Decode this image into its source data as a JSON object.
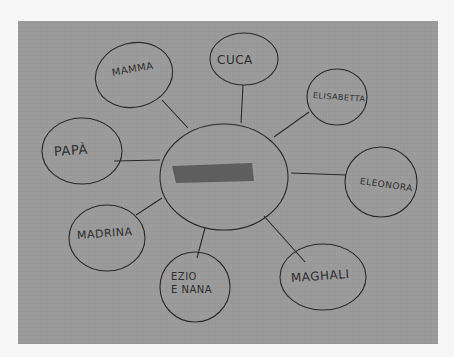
{
  "diagram": {
    "type": "hand-drawn mind map (photograph)",
    "paper_color": "#9a9a9a",
    "ink_color": "#2a2a2a",
    "border_color": "#f7f7f7",
    "center": {
      "label": "[redacted]",
      "redacted": true
    },
    "nodes": [
      {
        "id": "mamma",
        "label": "MAMMA"
      },
      {
        "id": "cuca",
        "label": "CUCA"
      },
      {
        "id": "elisabetta",
        "label": "ELISABETTA"
      },
      {
        "id": "eleonora",
        "label": "ELEONORA"
      },
      {
        "id": "maghali",
        "label": "MAGHALI"
      },
      {
        "id": "ezio-e-nana",
        "label": "EZIO\nE NANA"
      },
      {
        "id": "madrina",
        "label": "MADRINA"
      },
      {
        "id": "papa",
        "label": "PAPÀ"
      }
    ]
  }
}
